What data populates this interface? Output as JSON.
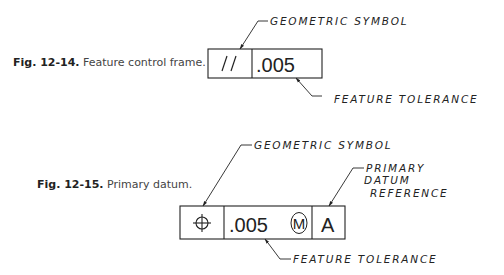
{
  "figures": [
    {
      "number": "Fig. 12-14.",
      "caption": "Feature control frame.",
      "frame": {
        "cells": [
          {
            "type": "symbol",
            "symbol": "parallelism-icon",
            "text": "//"
          },
          {
            "type": "tolerance",
            "text": ".005"
          }
        ]
      },
      "callouts": {
        "geometric_symbol": "GEOMETRIC SYMBOL",
        "feature_tolerance": "FEATURE TOLERANCE"
      }
    },
    {
      "number": "Fig. 12-15.",
      "caption": "Primary datum.",
      "frame": {
        "cells": [
          {
            "type": "symbol",
            "symbol": "position-icon",
            "text": "⌖"
          },
          {
            "type": "tolerance",
            "text": ".005",
            "modifier": "M"
          },
          {
            "type": "datum",
            "text": "A"
          }
        ]
      },
      "callouts": {
        "geometric_symbol": "GEOMETRIC SYMBOL",
        "primary_datum_line1": "PRIMARY",
        "primary_datum_line2": "DATUM",
        "primary_datum_line3": "REFERENCE",
        "feature_tolerance": "FEATURE TOLERANCE"
      }
    }
  ],
  "colors": {
    "ink": "#222222",
    "background": "#ffffff"
  }
}
